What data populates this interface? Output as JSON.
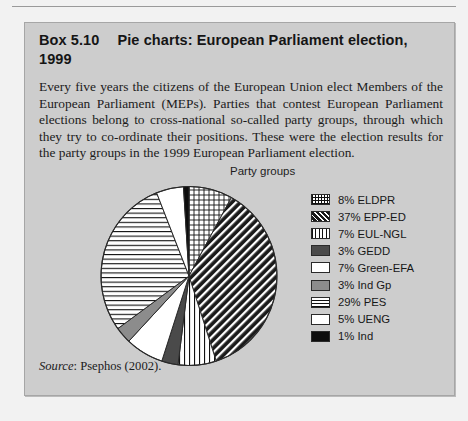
{
  "box": {
    "heading_number": "Box 5.10",
    "heading_text": "Pie charts: European Parliament election, 1999",
    "body_text": "Every five years the citizens of the European Union elect Members of the European Parliament (MEPs). Parties that contest European Parliament elections belong to cross-national so-called party groups, through which they try to co-ordinate their positions. These were the election results for the party groups in the 1999 European Parliament election.",
    "source_word": "Source",
    "source_text": ": Psephos (2002)."
  },
  "chart_data": {
    "type": "pie",
    "title": "Party groups",
    "legend_position": "right",
    "start_angle_deg": 0,
    "direction": "clockwise",
    "units": "percent",
    "categories": [
      "ELDPR",
      "EPP-ED",
      "EUL-NGL",
      "GEDD",
      "Green-EFA",
      "Ind Gp",
      "PES",
      "UENG",
      "Ind"
    ],
    "values": [
      8,
      37,
      7,
      3,
      7,
      3,
      29,
      5,
      1
    ],
    "slices": [
      {
        "label": "ELDPR",
        "value": 8,
        "legend_text": "8%  ELDPR",
        "pattern": "crosshatch",
        "fill": "#ffffff"
      },
      {
        "label": "EPP-ED",
        "value": 37,
        "legend_text": "37% EPP-ED",
        "pattern": "diagonal",
        "fill": "#1a1a1a"
      },
      {
        "label": "EUL-NGL",
        "value": 7,
        "legend_text": "7% EUL-NGL",
        "pattern": "vertical",
        "fill": "#ffffff"
      },
      {
        "label": "GEDD",
        "value": 3,
        "legend_text": "3% GEDD",
        "pattern": "solid-darkgray",
        "fill": "#4a4a4a"
      },
      {
        "label": "Green-EFA",
        "value": 7,
        "legend_text": "7% Green-EFA",
        "pattern": "white",
        "fill": "#ffffff"
      },
      {
        "label": "Ind Gp",
        "value": 3,
        "legend_text": "3% Ind Gp",
        "pattern": "solid-gray",
        "fill": "#8c8c8c"
      },
      {
        "label": "PES",
        "value": 29,
        "legend_text": "29% PES",
        "pattern": "horizontal",
        "fill": "#ffffff"
      },
      {
        "label": "UENG",
        "value": 5,
        "legend_text": "5% UENG",
        "pattern": "white",
        "fill": "#ffffff"
      },
      {
        "label": "Ind",
        "value": 1,
        "legend_text": "1% Ind",
        "pattern": "black",
        "fill": "#0d0d0d"
      }
    ]
  },
  "colors": {
    "page_background": "#f2f2f2",
    "box_background": "#cdcdcd",
    "box_border": "#a6a6a6",
    "text": "#1b1b1b",
    "rule": "#9a9a9a"
  }
}
